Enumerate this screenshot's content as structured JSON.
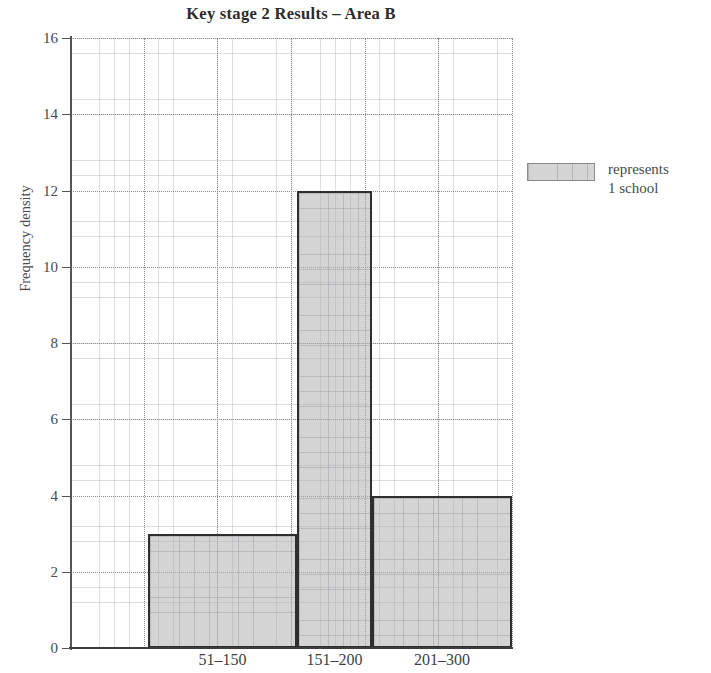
{
  "chart_data": {
    "type": "bar",
    "title": "Key stage 2 Results – Area B",
    "xlabel": "",
    "ylabel": "Frequency density",
    "categories": [
      "51–150",
      "151–200",
      "201–300"
    ],
    "values": [
      3,
      12,
      4
    ],
    "bar_edges": [
      {
        "label": "51–150",
        "left_px": 148,
        "right_px": 297,
        "value": 3
      },
      {
        "label": "151–200",
        "left_px": 297,
        "right_px": 372,
        "value": 12
      },
      {
        "label": "201–300",
        "left_px": 372,
        "right_px": 512,
        "value": 4
      }
    ],
    "ylim": [
      0,
      16
    ],
    "ytick_step": 2,
    "yticks": [
      0,
      2,
      4,
      6,
      8,
      10,
      12,
      14,
      16
    ],
    "ytick_labels": [
      "0",
      "2",
      "4",
      "6",
      "8",
      "10",
      "12",
      "14",
      "16"
    ],
    "grid": "graph-paper minor grid with dotted major gridlines",
    "grid_on": true,
    "legend_position": "right",
    "legend": [
      {
        "swatch": "shaded-grey",
        "text_line_1": "represents",
        "text_line_2": "1 school"
      }
    ],
    "annotations": [],
    "colors": {
      "bar_fill": "#b0b0b0",
      "bar_edge": "#2e2e2e",
      "grid_minor": "#969eaa",
      "grid_major": "#8d8d8d",
      "axis": "#555555",
      "text": "#4a4a4a",
      "title": "#2b2b2b",
      "background": "#ffffff"
    }
  },
  "legend": {
    "line1": "represents",
    "line2": "1 school"
  }
}
